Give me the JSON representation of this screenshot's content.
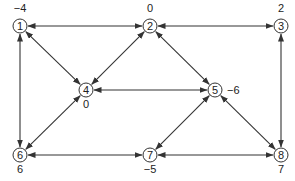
{
  "diagram": {
    "type": "network-graph",
    "nodes": [
      {
        "id": "1",
        "x": 20,
        "y": 26,
        "value": "−4",
        "lx": 20,
        "ly": 12,
        "anchor": "middle"
      },
      {
        "id": "2",
        "x": 150,
        "y": 26,
        "value": "0",
        "lx": 150,
        "ly": 12,
        "anchor": "middle"
      },
      {
        "id": "3",
        "x": 281,
        "y": 26,
        "value": "2",
        "lx": 281,
        "ly": 12,
        "anchor": "middle"
      },
      {
        "id": "4",
        "x": 86,
        "y": 90,
        "value": "0",
        "lx": 86,
        "ly": 108,
        "anchor": "middle"
      },
      {
        "id": "5",
        "x": 215,
        "y": 90,
        "value": "−6",
        "lx": 227,
        "ly": 94,
        "anchor": "start"
      },
      {
        "id": "6",
        "x": 20,
        "y": 155,
        "value": "6",
        "lx": 20,
        "ly": 173,
        "anchor": "middle"
      },
      {
        "id": "7",
        "x": 150,
        "y": 155,
        "value": "−5",
        "lx": 150,
        "ly": 173,
        "anchor": "middle"
      },
      {
        "id": "8",
        "x": 281,
        "y": 155,
        "value": "7",
        "lx": 281,
        "ly": 173,
        "anchor": "middle"
      }
    ],
    "edges": [
      {
        "from": "1",
        "to": "2",
        "bidirectional": true
      },
      {
        "from": "2",
        "to": "3",
        "bidirectional": true
      },
      {
        "from": "1",
        "to": "4",
        "bidirectional": true
      },
      {
        "from": "2",
        "to": "4",
        "bidirectional": true
      },
      {
        "from": "2",
        "to": "5",
        "bidirectional": true
      },
      {
        "from": "4",
        "to": "5",
        "bidirectional": true
      },
      {
        "from": "1",
        "to": "6",
        "bidirectional": true
      },
      {
        "from": "4",
        "to": "6",
        "bidirectional": true
      },
      {
        "from": "3",
        "to": "8",
        "bidirectional": true
      },
      {
        "from": "5",
        "to": "7",
        "bidirectional": true
      },
      {
        "from": "5",
        "to": "8",
        "bidirectional": true
      },
      {
        "from": "6",
        "to": "7",
        "bidirectional": true
      },
      {
        "from": "7",
        "to": "8",
        "bidirectional": true
      }
    ],
    "node_radius": 7,
    "colors": {
      "stroke": "#333333",
      "text": "#222222",
      "background": "#ffffff"
    }
  }
}
